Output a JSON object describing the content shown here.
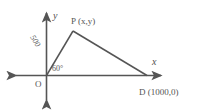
{
  "diagram": {
    "background_color": "#ffffff",
    "stroke_color": "#555555",
    "axes": {
      "x_label": "x",
      "y_label": "y",
      "origin_label": "O"
    },
    "points": [
      {
        "id": "O",
        "label": "O",
        "x_px": 46,
        "y_px": 75
      },
      {
        "id": "P",
        "label": "P (x,y)",
        "x_px": 73,
        "y_px": 31
      },
      {
        "id": "D",
        "label": "D (1000,0)",
        "x_px": 147,
        "y_px": 75
      }
    ],
    "segments": [
      {
        "id": "OP",
        "from": "O",
        "to": "P",
        "length_label": "500"
      },
      {
        "id": "PD",
        "from": "P",
        "to": "D",
        "length_label": ""
      },
      {
        "id": "OD",
        "from": "O",
        "to": "D",
        "length_label": ""
      }
    ],
    "angles": [
      {
        "id": "angle-O",
        "at": "O",
        "label": "60°"
      }
    ],
    "labels": {
      "y_axis": "y",
      "x_axis": "x",
      "origin": "O",
      "point_p": "P (x,y)",
      "point_d": "D (1000,0)",
      "angle_o": "60°",
      "segment_op": "500"
    }
  }
}
